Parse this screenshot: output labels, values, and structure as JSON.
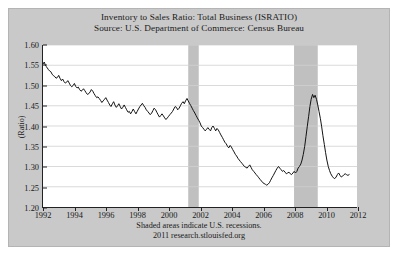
{
  "chart_data": {
    "type": "line",
    "title": "Inventory to Sales Ratio: Total Business (ISRATIO)",
    "subtitle": "Source: U.S. Department of Commerce: Census Bureau",
    "xlabel": "",
    "ylabel": "(Ratio)",
    "ylim": [
      1.2,
      1.6
    ],
    "xlim": [
      1992,
      2012
    ],
    "yticks": [
      "1.60",
      "1.55",
      "1.50",
      "1.45",
      "1.40",
      "1.35",
      "1.30",
      "1.25",
      "1.20"
    ],
    "ytick_values": [
      1.6,
      1.55,
      1.5,
      1.45,
      1.4,
      1.35,
      1.3,
      1.25,
      1.2
    ],
    "xticks": [
      "1992",
      "1994",
      "1996",
      "1998",
      "2000",
      "2002",
      "2004",
      "2006",
      "2008",
      "2010",
      "2012"
    ],
    "xtick_values": [
      1992,
      1994,
      1996,
      1998,
      2000,
      2002,
      2004,
      2006,
      2008,
      2010,
      2012
    ],
    "grid": "horizontal",
    "legend": "none",
    "line_color": "#111111",
    "recession_band_color": "#c0c0c0",
    "plot_background": "#ffffff",
    "figure_background": "#c9c9c9",
    "footer_note": "Shaded areas indicate U.S. recessions.",
    "footer_source": "2011 research.stlouisfed.org",
    "recessions": [
      {
        "start": 2001.25,
        "end": 2001.92
      },
      {
        "start": 2007.99,
        "end": 2009.5
      }
    ],
    "series": [
      {
        "name": "Inventory to Sales Ratio: Total Business",
        "x": [
          1992.0,
          1992.08,
          1992.17,
          1992.25,
          1992.33,
          1992.42,
          1992.5,
          1992.58,
          1992.67,
          1992.75,
          1992.83,
          1992.92,
          1993.0,
          1993.08,
          1993.17,
          1993.25,
          1993.33,
          1993.42,
          1993.5,
          1993.58,
          1993.67,
          1993.75,
          1993.83,
          1993.92,
          1994.0,
          1994.08,
          1994.17,
          1994.25,
          1994.33,
          1994.42,
          1994.5,
          1994.58,
          1994.67,
          1994.75,
          1994.83,
          1994.92,
          1995.0,
          1995.08,
          1995.17,
          1995.25,
          1995.33,
          1995.42,
          1995.5,
          1995.58,
          1995.67,
          1995.75,
          1995.83,
          1995.92,
          1996.0,
          1996.08,
          1996.17,
          1996.25,
          1996.33,
          1996.42,
          1996.5,
          1996.58,
          1996.67,
          1996.75,
          1996.83,
          1996.92,
          1997.0,
          1997.08,
          1997.17,
          1997.25,
          1997.33,
          1997.42,
          1997.5,
          1997.58,
          1997.67,
          1997.75,
          1997.83,
          1997.92,
          1998.0,
          1998.08,
          1998.17,
          1998.25,
          1998.33,
          1998.42,
          1998.5,
          1998.58,
          1998.67,
          1998.75,
          1998.83,
          1998.92,
          1999.0,
          1999.08,
          1999.17,
          1999.25,
          1999.33,
          1999.42,
          1999.5,
          1999.58,
          1999.67,
          1999.75,
          1999.83,
          1999.92,
          2000.0,
          2000.08,
          2000.17,
          2000.25,
          2000.33,
          2000.42,
          2000.5,
          2000.58,
          2000.67,
          2000.75,
          2000.83,
          2000.92,
          2001.0,
          2001.08,
          2001.17,
          2001.25,
          2001.33,
          2001.42,
          2001.5,
          2001.58,
          2001.67,
          2001.75,
          2001.83,
          2001.92,
          2002.0,
          2002.08,
          2002.17,
          2002.25,
          2002.33,
          2002.42,
          2002.5,
          2002.58,
          2002.67,
          2002.75,
          2002.83,
          2002.92,
          2003.0,
          2003.08,
          2003.17,
          2003.25,
          2003.33,
          2003.42,
          2003.5,
          2003.58,
          2003.67,
          2003.75,
          2003.83,
          2003.92,
          2004.0,
          2004.08,
          2004.17,
          2004.25,
          2004.33,
          2004.42,
          2004.5,
          2004.58,
          2004.67,
          2004.75,
          2004.83,
          2004.92,
          2005.0,
          2005.08,
          2005.17,
          2005.25,
          2005.33,
          2005.42,
          2005.5,
          2005.58,
          2005.67,
          2005.75,
          2005.83,
          2005.92,
          2006.0,
          2006.08,
          2006.17,
          2006.25,
          2006.33,
          2006.42,
          2006.5,
          2006.58,
          2006.67,
          2006.75,
          2006.83,
          2006.92,
          2007.0,
          2007.08,
          2007.17,
          2007.25,
          2007.33,
          2007.42,
          2007.5,
          2007.58,
          2007.67,
          2007.75,
          2007.83,
          2007.92,
          2008.0,
          2008.08,
          2008.17,
          2008.25,
          2008.33,
          2008.42,
          2008.5,
          2008.58,
          2008.67,
          2008.75,
          2008.83,
          2008.92,
          2009.0,
          2009.08,
          2009.17,
          2009.25,
          2009.33,
          2009.42,
          2009.5,
          2009.58,
          2009.67,
          2009.75,
          2009.83,
          2009.92,
          2010.0,
          2010.08,
          2010.17,
          2010.25,
          2010.33,
          2010.42,
          2010.5,
          2010.58,
          2010.67,
          2010.75,
          2010.83,
          2010.92,
          2011.0,
          2011.08,
          2011.17,
          2011.25,
          2011.33,
          2011.42,
          2011.5
        ],
        "values": [
          1.553,
          1.558,
          1.548,
          1.545,
          1.54,
          1.536,
          1.534,
          1.528,
          1.524,
          1.522,
          1.518,
          1.52,
          1.525,
          1.518,
          1.512,
          1.516,
          1.51,
          1.506,
          1.508,
          1.512,
          1.506,
          1.5,
          1.497,
          1.5,
          1.505,
          1.498,
          1.494,
          1.496,
          1.49,
          1.486,
          1.488,
          1.492,
          1.487,
          1.482,
          1.478,
          1.48,
          1.484,
          1.49,
          1.486,
          1.48,
          1.475,
          1.47,
          1.472,
          1.468,
          1.463,
          1.458,
          1.462,
          1.466,
          1.47,
          1.464,
          1.458,
          1.452,
          1.448,
          1.455,
          1.46,
          1.452,
          1.446,
          1.45,
          1.455,
          1.448,
          1.442,
          1.446,
          1.452,
          1.446,
          1.44,
          1.434,
          1.436,
          1.43,
          1.436,
          1.442,
          1.436,
          1.43,
          1.436,
          1.442,
          1.448,
          1.452,
          1.456,
          1.45,
          1.446,
          1.44,
          1.436,
          1.432,
          1.428,
          1.432,
          1.438,
          1.444,
          1.44,
          1.434,
          1.428,
          1.422,
          1.426,
          1.43,
          1.425,
          1.42,
          1.416,
          1.42,
          1.424,
          1.428,
          1.432,
          1.436,
          1.442,
          1.448,
          1.446,
          1.44,
          1.444,
          1.45,
          1.456,
          1.46,
          1.455,
          1.462,
          1.468,
          1.462,
          1.456,
          1.45,
          1.444,
          1.438,
          1.432,
          1.426,
          1.42,
          1.414,
          1.408,
          1.4,
          1.396,
          1.392,
          1.388,
          1.392,
          1.396,
          1.392,
          1.388,
          1.396,
          1.4,
          1.394,
          1.388,
          1.394,
          1.39,
          1.384,
          1.378,
          1.372,
          1.366,
          1.36,
          1.356,
          1.35,
          1.346,
          1.352,
          1.348,
          1.342,
          1.336,
          1.33,
          1.326,
          1.32,
          1.316,
          1.312,
          1.308,
          1.304,
          1.3,
          1.298,
          1.296,
          1.3,
          1.304,
          1.298,
          1.292,
          1.288,
          1.284,
          1.28,
          1.276,
          1.272,
          1.268,
          1.264,
          1.26,
          1.258,
          1.256,
          1.254,
          1.256,
          1.26,
          1.266,
          1.272,
          1.278,
          1.284,
          1.29,
          1.296,
          1.3,
          1.296,
          1.292,
          1.288,
          1.29,
          1.286,
          1.282,
          1.284,
          1.286,
          1.282,
          1.28,
          1.284,
          1.288,
          1.284,
          1.288,
          1.296,
          1.3,
          1.306,
          1.316,
          1.33,
          1.35,
          1.374,
          1.398,
          1.424,
          1.448,
          1.466,
          1.478,
          1.47,
          1.476,
          1.466,
          1.452,
          1.436,
          1.418,
          1.398,
          1.376,
          1.354,
          1.334,
          1.316,
          1.3,
          1.29,
          1.282,
          1.276,
          1.272,
          1.27,
          1.274,
          1.28,
          1.284,
          1.278,
          1.274,
          1.276,
          1.28,
          1.282,
          1.28,
          1.278,
          1.28
        ]
      }
    ]
  }
}
